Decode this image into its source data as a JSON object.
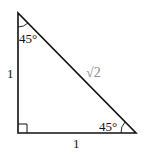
{
  "diagram": {
    "top_angle": "45°",
    "bottom_right_angle": "45°",
    "left_side": "1",
    "bottom_side": "1",
    "hypotenuse": "√2",
    "colors": {
      "stroke": "#111111",
      "hypotenuse_label": "#8a8a8a"
    }
  }
}
